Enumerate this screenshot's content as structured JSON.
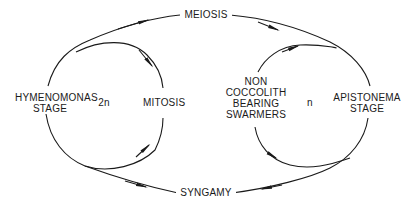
{
  "diagram": {
    "type": "life-cycle",
    "colors": {
      "line": "#1a1a1a",
      "background": "#ffffff"
    },
    "transitions": {
      "top": "MEIOSIS",
      "bottom": "SYNGAMY"
    },
    "left_phase": {
      "stage_line1": "HYMENOMONAS",
      "stage_line2": "STAGE",
      "ploidy": "2n",
      "cycle": "MITOSIS"
    },
    "right_phase": {
      "swarmer_line1": "NON",
      "swarmer_line2": "COCCOLITH",
      "swarmer_line3": "BEARING",
      "swarmer_line4": "SWARMERS",
      "ploidy": "n",
      "stage_line1": "APISTONEMA",
      "stage_line2": "STAGE"
    }
  }
}
